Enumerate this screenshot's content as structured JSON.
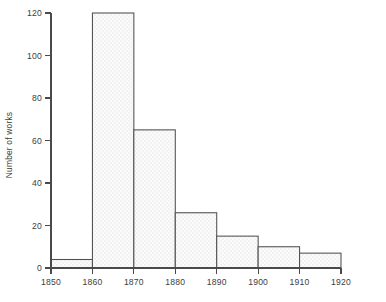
{
  "chart_data": {
    "type": "bar",
    "title": "",
    "subtitle": "",
    "xlabel": "",
    "ylabel": "Number of works",
    "categories": [
      "1850",
      "1860",
      "1870",
      "1880",
      "1890",
      "1900",
      "1910"
    ],
    "bin_edges": [
      1850,
      1860,
      1870,
      1880,
      1890,
      1900,
      1910,
      1920
    ],
    "values": [
      4,
      120,
      65,
      26,
      15,
      10,
      7
    ],
    "bins": [
      {
        "start": 1850,
        "end": 1860,
        "value": 4
      },
      {
        "start": 1860,
        "end": 1870,
        "value": 120
      },
      {
        "start": 1870,
        "end": 1880,
        "value": 65
      },
      {
        "start": 1880,
        "end": 1890,
        "value": 26
      },
      {
        "start": 1890,
        "end": 1900,
        "value": 15
      },
      {
        "start": 1900,
        "end": 1910,
        "value": 10
      },
      {
        "start": 1910,
        "end": 1920,
        "value": 7
      }
    ],
    "xlim": [
      1850,
      1920
    ],
    "ylim": [
      0,
      120
    ],
    "xticks": [
      1850,
      1860,
      1870,
      1880,
      1890,
      1900,
      1910,
      1920
    ],
    "xtick_labels": [
      "1850",
      "1860",
      "1870",
      "1880",
      "1890",
      "1900",
      "1910",
      "1920"
    ],
    "yticks": [
      0,
      20,
      40,
      60,
      80,
      100,
      120
    ],
    "ytick_labels": [
      "0",
      "20",
      "40",
      "60",
      "80",
      "100",
      "120"
    ],
    "grid": false,
    "legend": null,
    "legend_position": "none",
    "annotations": []
  },
  "style": {
    "background_color": "#ffffff",
    "bar_outline_color": "#4f4f4f",
    "bar_fill_color": "#f4f4f4",
    "axis_color": "#4a4a4a",
    "text_color": "#3d3d3d"
  }
}
